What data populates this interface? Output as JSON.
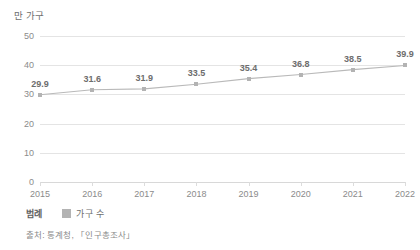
{
  "chart_data": {
    "type": "line",
    "title": "",
    "subtitle": "",
    "xlabel": "",
    "ylabel": "만 가구",
    "categories": [
      "2015",
      "2016",
      "2017",
      "2018",
      "2019",
      "2020",
      "2021",
      "2022"
    ],
    "values": [
      29.9,
      31.6,
      31.9,
      33.5,
      35.4,
      36.8,
      38.5,
      39.9
    ],
    "series": [
      {
        "name": "가구 수",
        "values": [
          29.9,
          31.6,
          31.9,
          33.5,
          35.4,
          36.8,
          38.5,
          39.9
        ],
        "color": "#b3b3b3",
        "marker": "square",
        "data_labels": [
          "29.9",
          "31.6",
          "31.9",
          "33.5",
          "35.4",
          "36.8",
          "38.5",
          "39.9"
        ]
      }
    ],
    "ylim": [
      0,
      50
    ],
    "yticks": [
      0,
      10,
      20,
      30,
      40,
      50
    ],
    "ytick_labels": [
      "0",
      "10",
      "20",
      "30",
      "40",
      "50"
    ],
    "grid": true,
    "grid_axis": "y",
    "legend_position": "bottom-left",
    "show_data_labels": true
  },
  "axis": {
    "unit_title": "만 가구"
  },
  "legend": {
    "title": "범례",
    "entries": [
      {
        "label": "가구 수",
        "color": "#b3b3b3"
      }
    ]
  },
  "footer": {
    "source": "출처: 통계청, 「인구총조사」"
  },
  "colors": {
    "line": "#b9b9b9",
    "marker": "#b6b6b6",
    "grid": "#e4e4e4",
    "baseline": "#d8d8d8",
    "text": "#7d7d7d",
    "background": "#ffffff"
  }
}
